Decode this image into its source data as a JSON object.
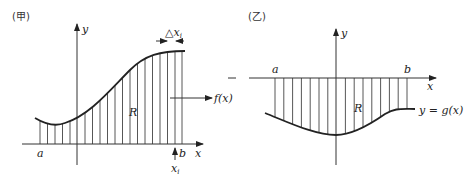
{
  "panels": [
    {
      "id": "jia",
      "caption": "(甲)",
      "y_axis_label": "y",
      "x_axis_label": "x",
      "a_label": "a",
      "b_label": "b",
      "region_label": "R",
      "function_label": "f(x)",
      "delta_label": "△x",
      "delta_sub": "i",
      "xi_label": "x",
      "xi_sub": "i"
    },
    {
      "id": "yi",
      "caption": "(乙)",
      "y_axis_label": "y",
      "x_axis_label": "x",
      "a_label": "a",
      "b_label": "b",
      "region_label": "R",
      "function_label": "y = g(x)"
    }
  ]
}
